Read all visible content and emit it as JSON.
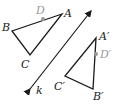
{
  "diagram": {
    "colors": {
      "stroke": "#1a1a1a",
      "highlight": "#9a9a9a",
      "background": "#ffffff"
    },
    "line_k": {
      "label": "k",
      "from": [
        93,
        8
      ],
      "to": [
        28,
        92
      ]
    },
    "preimage": {
      "points": {
        "A": {
          "label": "A",
          "xy": [
            62,
            14
          ]
        },
        "B": {
          "label": "B",
          "xy": [
            12,
            31
          ]
        },
        "C": {
          "label": "C",
          "xy": [
            30,
            55
          ]
        },
        "D": {
          "label": "D",
          "xy": [
            43,
            19
          ]
        }
      }
    },
    "image": {
      "points": {
        "A": {
          "label": "A′",
          "xy": [
            96,
            38
          ]
        },
        "B": {
          "label": "B′",
          "xy": [
            93,
            89
          ]
        },
        "C": {
          "label": "C′",
          "xy": [
            65,
            76
          ]
        },
        "D": {
          "label": "D′",
          "xy": [
            96,
            54
          ]
        }
      }
    }
  }
}
